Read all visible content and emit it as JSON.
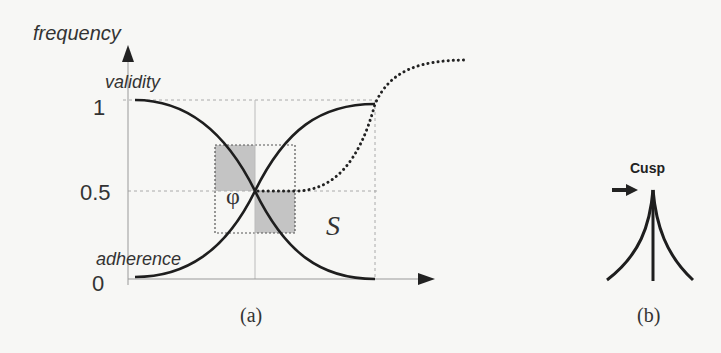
{
  "panel_a": {
    "y_axis_label": "frequency",
    "curve_label_top": "validity",
    "curve_label_bottom": "adherence",
    "y_ticks": [
      "1",
      "0.5",
      "0"
    ],
    "crossing_label": "φ",
    "region_label": "S",
    "caption": "(a)"
  },
  "panel_b": {
    "title": "Cusp",
    "caption": "(b)"
  },
  "colors": {
    "curve": "#1e1e1e",
    "axis": "#999999",
    "gridline": "#aaaaaa",
    "shaded": "#c4c4c4",
    "background": "#f7f7f5"
  }
}
